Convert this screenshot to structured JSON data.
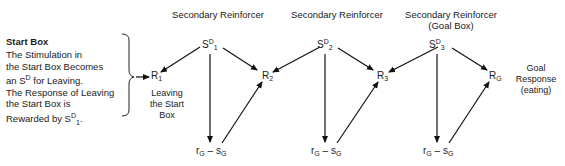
{
  "diagram": {
    "headers": [
      {
        "line1": "Secondary Reinforcer",
        "line2": ""
      },
      {
        "line1": "Secondary Reinforcer",
        "line2": ""
      },
      {
        "line1": "Secondary Reinforcer",
        "line2": "(Goal Box)"
      }
    ],
    "start_box": {
      "title": "Start Box",
      "lines": [
        "The Stimulation in",
        "the Start Box Becomes",
        "an S",
        "D",
        " for Leaving.",
        "The Response of Leaving",
        "the Start Box is",
        "Rewarded by S",
        "D",
        "1",
        "."
      ]
    },
    "stimuli": [
      {
        "base": "S",
        "sup": "D",
        "sub": "1"
      },
      {
        "base": "S",
        "sup": "D",
        "sub": "2"
      },
      {
        "base": "S",
        "sup": "D",
        "sub": "3"
      }
    ],
    "responses": [
      {
        "base": "R",
        "sub": "1"
      },
      {
        "base": "R",
        "sub": "2"
      },
      {
        "base": "R",
        "sub": "3"
      },
      {
        "base": "R",
        "sub": "G"
      }
    ],
    "fractional": [
      {
        "r": "r",
        "r_sub": "G",
        "dash": " – ",
        "s": "s",
        "s_sub": "G"
      },
      {
        "r": "r",
        "r_sub": "G",
        "dash": " – ",
        "s": "s",
        "s_sub": "G"
      },
      {
        "r": "r",
        "r_sub": "G",
        "dash": " – ",
        "s": "s",
        "s_sub": "G"
      }
    ],
    "r1_caption": [
      "Leaving",
      "the Start",
      "Box"
    ],
    "goal_caption": [
      "Goal",
      "Response",
      "(eating)"
    ]
  }
}
